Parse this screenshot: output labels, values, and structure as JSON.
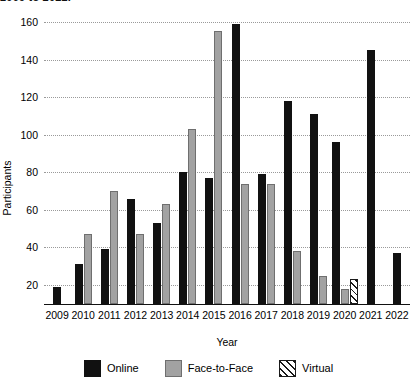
{
  "title": "2009 to 2022.",
  "chart_data": {
    "type": "bar",
    "title": "2009 to 2022.",
    "xlabel": "Year",
    "ylabel": "Participants",
    "categories": [
      "2009",
      "2010",
      "2011",
      "2012",
      "2013",
      "2014",
      "2015",
      "2016",
      "2017",
      "2018",
      "2019",
      "2020",
      "2021",
      "2022"
    ],
    "yticks": [
      20,
      40,
      60,
      80,
      100,
      120,
      140,
      160
    ],
    "ylim": [
      0,
      168
    ],
    "grid": "horizontal-dotted",
    "legend_position": "bottom",
    "series": [
      {
        "name": "Online",
        "color": "#111111",
        "values": [
          19,
          31,
          39,
          66,
          53,
          80,
          77,
          159,
          79,
          118,
          111,
          96,
          145,
          37
        ]
      },
      {
        "name": "Face-to-Face",
        "color": "#a2a2a2",
        "values": [
          null,
          47,
          70,
          47,
          63,
          103,
          155,
          74,
          74,
          38,
          25,
          18,
          null,
          null
        ]
      },
      {
        "name": "Virtual",
        "color": "#ffffff",
        "pattern": "diagonal-hatch",
        "values": [
          null,
          null,
          null,
          null,
          null,
          null,
          null,
          null,
          null,
          null,
          null,
          23,
          null,
          null
        ]
      }
    ]
  },
  "legend": [
    {
      "label": "Online",
      "key": "online"
    },
    {
      "label": "Face-to-Face",
      "key": "f2f"
    },
    {
      "label": "Virtual",
      "key": "virtual"
    }
  ]
}
